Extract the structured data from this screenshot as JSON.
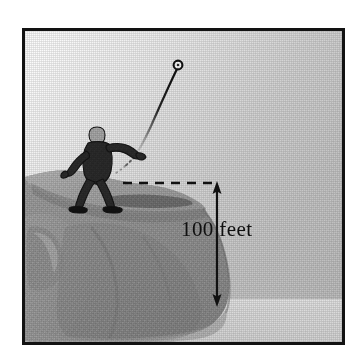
{
  "figure": {
    "kind": "physics-textbook-illustration",
    "frame": {
      "border_color": "#121212",
      "border_width_px": 3,
      "x": 22,
      "y": 28,
      "width": 323,
      "height": 317
    },
    "background": {
      "sky_light": "#f2f2f2",
      "sky_mid": "#c9c9c9",
      "sky_dark": "#b4b4b4",
      "ground_plane": "#d8d8d8",
      "ground_plane_shadow": "#c2c2c2"
    },
    "cliff": {
      "label": "cliff",
      "top_face_color": "#a9a9a9",
      "front_face_color": "#9a9a9a",
      "shadow_color": "#8a8a8a",
      "highlight_color": "#b8b8b8",
      "edge_shadow_color": "#6f6f6f"
    },
    "thrower": {
      "label": "person throwing ball",
      "body_color": "#272727",
      "head_color": "#a8a8a8",
      "outline_color": "#111111",
      "cast_shadow_color": "#6a6a6a"
    },
    "ball": {
      "label": "ball",
      "fill": "#ffffff",
      "outline": "#111111",
      "center_x": 175,
      "center_y": 62,
      "radius_px": 4
    },
    "trajectory": {
      "label": "ball flight path",
      "color": "#222222",
      "style": "curved tapering dotted-to-solid arc"
    },
    "dimension": {
      "label_text": "100 feet",
      "value": 100,
      "units": "feet",
      "line_color": "#111111",
      "dashed_leader_color": "#111111",
      "arrow_top_y": 180,
      "arrow_bottom_y": 302,
      "axis_x": 214,
      "leader_start_x": 120,
      "leader_end_x": 214,
      "leader_y": 180,
      "text_x": 178,
      "text_y": 219
    }
  }
}
